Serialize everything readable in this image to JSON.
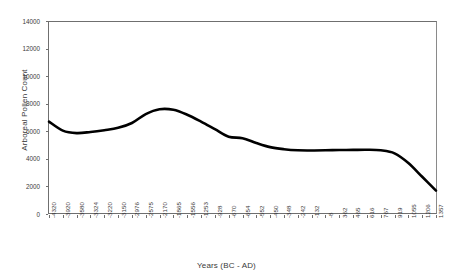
{
  "chart_data": {
    "type": "line",
    "title": "",
    "xlabel": "Years (BC - AD)",
    "ylabel": "Arboreal Pollen Count",
    "ylim": [
      0,
      14000
    ],
    "y_ticks": [
      0,
      2000,
      4000,
      6000,
      8000,
      10000,
      12000,
      14000
    ],
    "y_tick_labels": [
      "0",
      "2000",
      "4000",
      "6000",
      "8000",
      "10000",
      "12000",
      "14000"
    ],
    "grid": false,
    "legend": "none",
    "categories": [
      "-4320",
      "-3920",
      "-3580",
      "-3324",
      "-3220",
      "-3150",
      "-2976",
      "-2575",
      "-2170",
      "-1865",
      "-1556",
      "-1253",
      "-928",
      "-670",
      "-654",
      "-552",
      "-450",
      "-348",
      "-242",
      "-132",
      "-8",
      "362",
      "465",
      "616",
      "767",
      "919",
      "1055",
      "1206",
      "1357"
    ],
    "series": [
      {
        "name": "Arboreal Pollen Count",
        "color": "#000000",
        "values": [
          6700,
          6050,
          5870,
          5950,
          6080,
          6250,
          6600,
          7250,
          7600,
          7560,
          7200,
          6700,
          6150,
          5600,
          5500,
          5150,
          4850,
          4700,
          4620,
          4610,
          4620,
          4640,
          4650,
          4660,
          4620,
          4400,
          3700,
          2700,
          1700
        ]
      }
    ]
  },
  "axes": {
    "x_title": "Years (BC - AD)",
    "y_title": "Arboreal Pollen Count"
  }
}
